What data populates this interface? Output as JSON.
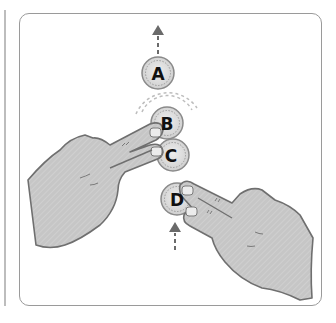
{
  "diagram": {
    "touch_points": [
      {
        "label": "A",
        "cx": 158,
        "cy": 73,
        "state": "moving-up"
      },
      {
        "label": "B",
        "cx": 166,
        "cy": 123,
        "state": "touched-by-left-hand",
        "ripple": true
      },
      {
        "label": "C",
        "cx": 170,
        "cy": 155,
        "state": "touched-by-left-hand"
      },
      {
        "label": "D",
        "cx": 177,
        "cy": 199,
        "state": "touched-by-right-hand"
      }
    ],
    "arrows": [
      {
        "name": "arrow-up-top",
        "direction": "up",
        "style": "dashed"
      },
      {
        "name": "arrow-up-bottom",
        "direction": "up",
        "style": "dashed"
      }
    ],
    "hands": [
      {
        "name": "left-hand",
        "gesture": "two-finger-touch"
      },
      {
        "name": "right-hand",
        "gesture": "two-finger-touch"
      }
    ],
    "colors": {
      "frame": "#9a9a9a",
      "hand_fill": "#c4c4c4",
      "hand_stroke": "#6f6f6f",
      "circle_fill": "#d9d9d9",
      "circle_stroke": "#8a8a8a",
      "arrow": "#6a6a6a",
      "label": "#111111"
    }
  }
}
